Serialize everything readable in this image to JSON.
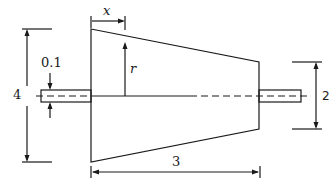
{
  "diagram": {
    "colors": {
      "stroke": "#1a1a1a",
      "background": "#ffffff"
    },
    "labels": {
      "x": "x",
      "r": "r",
      "shaft_diameter": "0.1",
      "left_diameter": "4",
      "right_diameter": "2",
      "length": "3"
    },
    "dimensions": {
      "left_diameter": 4,
      "right_diameter": 2,
      "length": 3,
      "shaft_diameter": 0.1
    }
  }
}
